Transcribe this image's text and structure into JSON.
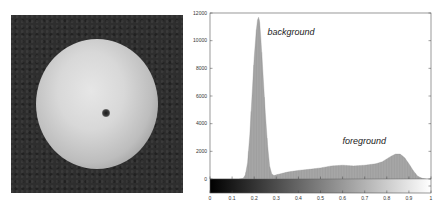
{
  "image": {
    "description": "grayscale photograph of an apple (top view) on dark background"
  },
  "chart_data": {
    "type": "bar",
    "title": "",
    "xlabel": "",
    "ylabel": "",
    "xlim": [
      0,
      1
    ],
    "ylim": [
      -1000,
      12000
    ],
    "grid": false,
    "legend": null,
    "x_ticks": [
      "0",
      "0.1",
      "0.2",
      "0.3",
      "0.4",
      "0.5",
      "0.6",
      "0.7",
      "0.8",
      "0.9",
      "1"
    ],
    "y_ticks": [
      "0",
      "2000",
      "4000",
      "6000",
      "8000",
      "10000",
      "12000"
    ],
    "annotations": [
      {
        "text": "background",
        "x": 0.26,
        "y": 10400
      },
      {
        "text": "foreground",
        "x": 0.6,
        "y": 2500
      }
    ],
    "colorbar": {
      "orientation": "horizontal",
      "from": "#000000",
      "to": "#ffffff",
      "range": [
        0,
        1
      ]
    },
    "x": [
      0.0,
      0.13,
      0.15,
      0.16,
      0.17,
      0.18,
      0.19,
      0.2,
      0.21,
      0.215,
      0.22,
      0.225,
      0.23,
      0.24,
      0.25,
      0.26,
      0.27,
      0.28,
      0.29,
      0.3,
      0.32,
      0.35,
      0.4,
      0.45,
      0.5,
      0.55,
      0.6,
      0.65,
      0.7,
      0.75,
      0.78,
      0.8,
      0.82,
      0.84,
      0.86,
      0.88,
      0.9,
      0.92,
      0.94,
      0.96,
      0.98,
      1.0
    ],
    "values": [
      0,
      0,
      50,
      300,
      1200,
      3200,
      6000,
      8800,
      10800,
      11500,
      11700,
      11300,
      10200,
      7600,
      4800,
      2500,
      900,
      350,
      250,
      300,
      380,
      500,
      620,
      700,
      800,
      950,
      1000,
      950,
      1000,
      1100,
      1250,
      1450,
      1650,
      1800,
      1800,
      1550,
      1100,
      600,
      200,
      50,
      0,
      0
    ]
  }
}
